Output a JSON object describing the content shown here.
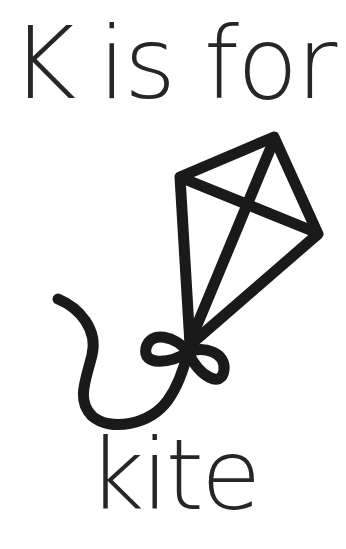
{
  "title": {
    "letter": "K",
    "connector": "is for"
  },
  "illustration": {
    "icon": "kite-icon",
    "stroke_color": "#1a1a1a"
  },
  "word": "kite"
}
